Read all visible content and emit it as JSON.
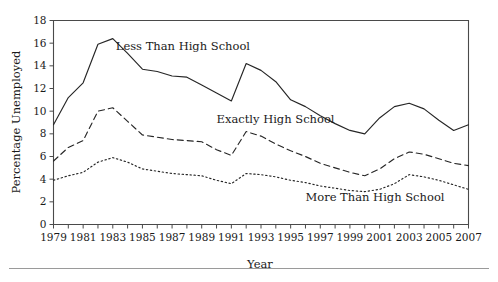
{
  "chart_data": {
    "type": "line",
    "title": "",
    "xlabel": "Year",
    "ylabel": "Percentage Unemployed",
    "xlim": [
      1979,
      2007
    ],
    "ylim": [
      0,
      18
    ],
    "grid": false,
    "legend_position": "inline-annotations",
    "x": [
      1979,
      1980,
      1981,
      1982,
      1983,
      1984,
      1985,
      1986,
      1987,
      1988,
      1989,
      1990,
      1991,
      1992,
      1993,
      1994,
      1995,
      1996,
      1997,
      1998,
      1999,
      2000,
      2001,
      2002,
      2003,
      2004,
      2005,
      2006,
      2007
    ],
    "xticks": [
      "1979",
      "1981",
      "1983",
      "1985",
      "1987",
      "1989",
      "1991",
      "1993",
      "1995",
      "1997",
      "1999",
      "2001",
      "2003",
      "2005",
      "2007"
    ],
    "yticks": [
      "0",
      "2",
      "4",
      "6",
      "8",
      "10",
      "12",
      "14",
      "16",
      "18"
    ],
    "series": [
      {
        "name": "Less Than High School",
        "style": "solid",
        "label_x": 1983.2,
        "label_y": 15.4,
        "values": [
          8.8,
          11.2,
          12.5,
          15.9,
          16.4,
          15.1,
          13.7,
          13.5,
          13.1,
          13.0,
          12.3,
          11.6,
          10.9,
          14.2,
          13.6,
          12.6,
          11.0,
          10.4,
          9.6,
          8.9,
          8.3,
          8.0,
          9.4,
          10.4,
          10.7,
          10.2,
          9.2,
          8.3,
          8.8
        ]
      },
      {
        "name": "Exactly High School",
        "style": "dashed",
        "label_x": 1990.0,
        "label_y": 9.0,
        "values": [
          5.6,
          6.8,
          7.4,
          10.0,
          10.3,
          9.1,
          7.9,
          7.7,
          7.5,
          7.4,
          7.3,
          6.6,
          6.1,
          8.2,
          7.8,
          7.1,
          6.5,
          6.0,
          5.4,
          5.0,
          4.6,
          4.3,
          4.9,
          5.8,
          6.4,
          6.2,
          5.8,
          5.4,
          5.2
        ]
      },
      {
        "name": "More Than High School",
        "style": "dotted",
        "label_x": 1996.0,
        "label_y": 2.1,
        "values": [
          3.9,
          4.3,
          4.6,
          5.5,
          5.9,
          5.5,
          4.9,
          4.7,
          4.5,
          4.4,
          4.3,
          3.9,
          3.6,
          4.5,
          4.4,
          4.2,
          3.9,
          3.7,
          3.4,
          3.2,
          3.0,
          2.9,
          3.1,
          3.6,
          4.4,
          4.2,
          3.9,
          3.5,
          3.1
        ]
      }
    ]
  },
  "axes": {
    "x_title": "Year",
    "y_title": "Percentage Unemployed"
  }
}
